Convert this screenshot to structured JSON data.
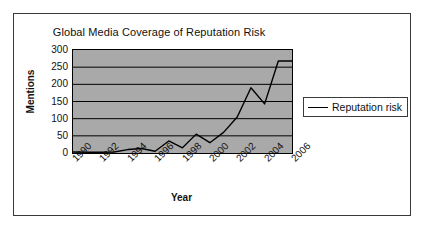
{
  "chart_data": {
    "type": "line",
    "title": "Global Media Coverage of Reputation Risk",
    "xlabel": "Year",
    "ylabel": "Mentions",
    "xlim": [
      1990,
      2006
    ],
    "ylim": [
      0,
      300
    ],
    "ytick_labels": [
      "300",
      "250",
      "200",
      "150",
      "100",
      "50",
      "0"
    ],
    "yticks": [
      300,
      250,
      200,
      150,
      100,
      50,
      0
    ],
    "xtick_labels": [
      "1990",
      "1992",
      "1994",
      "1996",
      "1998",
      "2000",
      "2002",
      "2004",
      "2006"
    ],
    "xticks": [
      1990,
      1992,
      1994,
      1996,
      1998,
      2000,
      2002,
      2004,
      2006
    ],
    "x": [
      1990,
      1991,
      1992,
      1993,
      1994,
      1995,
      1996,
      1997,
      1998,
      1999,
      2000,
      2001,
      2002,
      2003,
      2004,
      2005,
      2006
    ],
    "grid": true,
    "grid_axis": "y",
    "legend_position": "right",
    "plot_background": "#a9a9a9",
    "line_color": "#000000",
    "series": [
      {
        "name": "Reputation risk",
        "values": [
          3,
          2,
          2,
          3,
          10,
          13,
          5,
          35,
          15,
          55,
          30,
          60,
          105,
          190,
          143,
          268,
          268
        ]
      }
    ]
  },
  "legend": {
    "entries": [
      {
        "label": "Reputation risk"
      }
    ]
  }
}
